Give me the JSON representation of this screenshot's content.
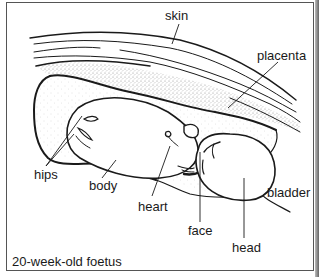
{
  "diagram": {
    "caption": "20-week-old foetus",
    "labels": {
      "skin": "skin",
      "placenta": "placenta",
      "hips": "hips",
      "body": "body",
      "heart": "heart",
      "face": "face",
      "head": "head",
      "bladder": "bladder"
    },
    "colors": {
      "line": "#1a1a1a",
      "stipple": "#9a9a9a",
      "frame": "#555555",
      "background": "#ffffff"
    }
  }
}
